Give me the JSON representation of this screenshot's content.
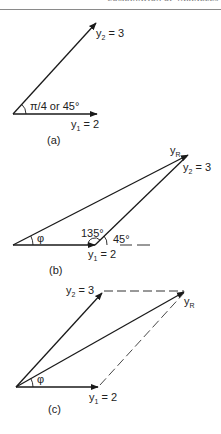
{
  "header": {
    "running_title": "COMBINATION OF VARIABLES"
  },
  "diagram_a": {
    "caption": "(a)",
    "y2_label": "y",
    "y2_sub": "2",
    "y2_value": " = 3",
    "y1_label": "y",
    "y1_sub": "1",
    "y1_value": " = 2",
    "angle_label": "π/4 or 45°"
  },
  "diagram_b": {
    "caption": "(b)",
    "yR_label": "y",
    "yR_sub": "R",
    "y2_label": "y",
    "y2_sub": "2",
    "y2_value": " = 3",
    "y1_label": "y",
    "y1_sub": "1",
    "y1_value": " = 2",
    "phi_label": "φ",
    "angle_135": "135°",
    "angle_45": "45°"
  },
  "diagram_c": {
    "caption": "(c)",
    "y2_label": "y",
    "y2_sub": "2",
    "y2_value": " = 3",
    "yR_label": "y",
    "yR_sub": "R",
    "y1_label": "y",
    "y1_sub": "1",
    "y1_value": " = 2",
    "phi_label": "φ"
  },
  "colors": {
    "line": "#1a1a1a",
    "dash": "#333333",
    "rule": "#8a8a8a"
  }
}
